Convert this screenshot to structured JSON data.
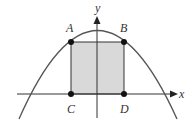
{
  "diagram": {
    "type": "parabola-with-inscribed-rectangle",
    "axes": {
      "x_label": "x",
      "y_label": "y"
    },
    "points": [
      {
        "name": "A",
        "label": "A",
        "px": 71,
        "py": 42
      },
      {
        "name": "B",
        "label": "B",
        "px": 124,
        "py": 42
      },
      {
        "name": "C",
        "label": "C",
        "px": 71,
        "py": 94
      },
      {
        "name": "D",
        "label": "D",
        "px": 124,
        "py": 94
      }
    ],
    "rectangle": {
      "vertices": [
        "A",
        "B",
        "D",
        "C"
      ],
      "fill": "#d9d9d9",
      "stroke": "#333333"
    },
    "curve": {
      "shape": "downward parabola",
      "stroke": "#555555"
    },
    "colors": {
      "ink": "#333333",
      "fill": "#d9d9d9",
      "background": "#ffffff"
    }
  }
}
